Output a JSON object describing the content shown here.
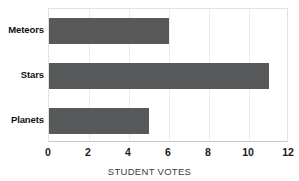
{
  "chart_data": {
    "type": "bar",
    "orientation": "horizontal",
    "title": "",
    "subtitle": "",
    "categories": [
      "Meteors",
      "Stars",
      "Planets"
    ],
    "values": [
      6,
      11,
      5
    ],
    "xlabel": "STUDENT VOTES",
    "ylabel": "",
    "xlim": [
      0,
      12
    ],
    "xticks": [
      0,
      2,
      4,
      6,
      8,
      10,
      12
    ],
    "xtick_labels": [
      "0",
      "2",
      "4",
      "6",
      "8",
      "10",
      "12"
    ],
    "grid": true,
    "grid_axis": "x",
    "legend": false,
    "legend_position": "none",
    "bar_color": "#58595b",
    "plot_border_color": "#e2e2e2",
    "gridline_color": "#ececec",
    "background_color": "#ffffff",
    "annotations": []
  }
}
